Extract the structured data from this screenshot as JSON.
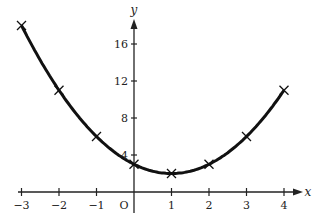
{
  "chart_data": {
    "type": "line",
    "title": "",
    "xlabel": "x",
    "ylabel": "y",
    "origin_label": "O",
    "x": [
      -3,
      -2,
      -1,
      0,
      1,
      2,
      3,
      4
    ],
    "series": [
      {
        "name": "y = x^2 - 2x + 3",
        "values": [
          18,
          11,
          6,
          3,
          2,
          3,
          6,
          11
        ],
        "marker": "x"
      }
    ],
    "x_ticks": [
      "-3",
      "-2",
      "-1",
      "1",
      "2",
      "3",
      "4"
    ],
    "y_ticks": [
      "4",
      "8",
      "12",
      "16"
    ],
    "xlim": [
      -3,
      4.5
    ],
    "ylim": [
      0,
      20
    ],
    "grid": false,
    "legend": "none"
  }
}
